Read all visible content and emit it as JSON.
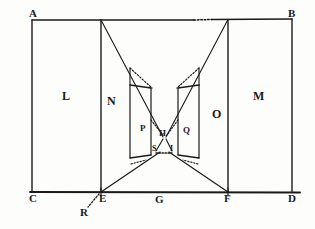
{
  "figure": {
    "type": "geometric-optics-diagram",
    "ink_color": "#1a1a1a",
    "background_color": "#fdfdfc"
  },
  "labels": {
    "corner_top_left": "A",
    "corner_top_right": "B",
    "corner_bottom_left": "C",
    "corner_bottom_right": "D",
    "baseline_left": "E",
    "baseline_center": "G",
    "baseline_right": "F",
    "below_baseline_left": "R",
    "region_left": "L",
    "region_right": "M",
    "region_inner_left": "N",
    "region_inner_right": "O",
    "region_core_left": "P",
    "region_core_right": "Q",
    "center_top": "H",
    "center_lower_left": "S",
    "center_lower_right": "I"
  },
  "geometry": {
    "frame": {
      "left": 32,
      "top": 20,
      "right": 292,
      "bottom": 192
    },
    "inner_vertical_left_x": 101,
    "inner_vertical_right_x": 228,
    "baseline_E_x": 101,
    "baseline_F_x": 228,
    "baseline_G_x": 160,
    "apex_top_left_x": 101,
    "apex_top_right_x": 228,
    "core_left_outer_x": 130,
    "core_left_inner_x": 151,
    "core_right_inner_x": 178,
    "core_right_outer_x": 199,
    "core_top_y": 85,
    "core_bottom_y": 158,
    "center_H_y": 136,
    "center_SI_y": 152,
    "R_point": {
      "x": 86,
      "y": 210
    }
  }
}
